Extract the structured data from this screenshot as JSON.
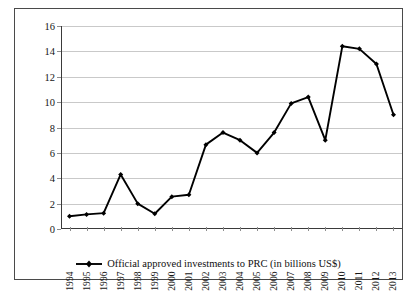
{
  "chart_data": {
    "type": "line",
    "title": "",
    "xlabel": "",
    "ylabel": "",
    "ylim": [
      0,
      16
    ],
    "ytick_step": 2,
    "yticks": [
      0,
      2,
      4,
      6,
      8,
      10,
      12,
      14,
      16
    ],
    "grid": true,
    "legend_position": "bottom-center",
    "categories": [
      "1994",
      "1995",
      "1996",
      "1997",
      "1998",
      "1999",
      "2000",
      "2001",
      "2002",
      "2003",
      "2004",
      "2005",
      "2006",
      "2007",
      "2008",
      "2009",
      "2010",
      "2011",
      "2012",
      "2013"
    ],
    "series": [
      {
        "name": "Official approved investments to PRC (in billions US$)",
        "marker": "filled-diamond",
        "color": "#000000",
        "values": [
          1.0,
          1.15,
          1.25,
          4.3,
          2.0,
          1.2,
          2.55,
          2.7,
          6.65,
          7.6,
          7.0,
          6.0,
          7.6,
          9.9,
          10.4,
          7.0,
          14.4,
          14.2,
          13.0,
          9.0
        ]
      }
    ],
    "annotations": []
  },
  "legend": {
    "items": [
      {
        "label": "Official approved investments to PRC (in billions US$)",
        "key_color": "#000000"
      }
    ]
  },
  "axes": {
    "y": {
      "labels": [
        "16",
        "14",
        "12",
        "10",
        "8",
        "6",
        "4",
        "2",
        "0"
      ]
    },
    "x": {
      "labels": [
        "1994",
        "1995",
        "1996",
        "1997",
        "1998",
        "1999",
        "2000",
        "2001",
        "2002",
        "2003",
        "2004",
        "2005",
        "2006",
        "2007",
        "2008",
        "2009",
        "2010",
        "2011",
        "2012",
        "2013"
      ]
    }
  },
  "colors": {
    "grid": "#c9c9c9",
    "axis": "#3a3a3a",
    "series": "#000000",
    "border": "#4a4a4a",
    "background": "#ffffff"
  }
}
